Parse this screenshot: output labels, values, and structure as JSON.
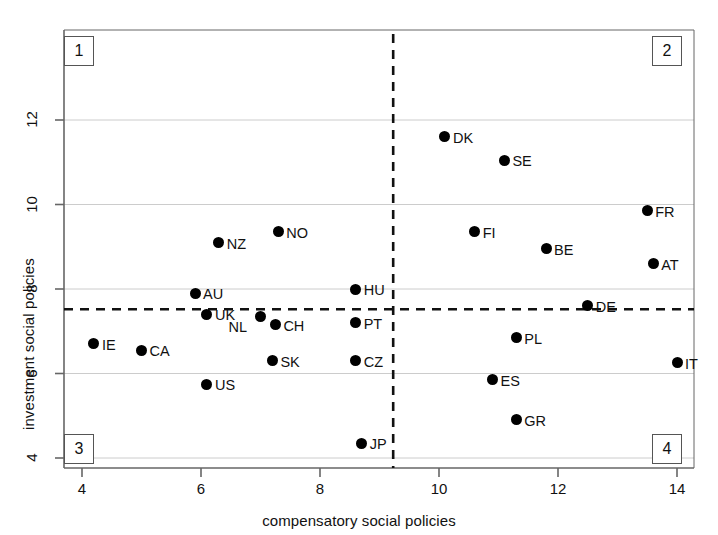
{
  "chart_data": {
    "type": "scatter",
    "title": "",
    "xlabel": "compensatory social policies",
    "ylabel": "investment social policies",
    "xlim": [
      3.6,
      14.4
    ],
    "ylim": [
      3.6,
      13.3
    ],
    "xticks": [
      4,
      6,
      8,
      10,
      12,
      14
    ],
    "yticks": [
      4,
      6,
      8,
      10,
      12
    ],
    "grid": "horizontal-only",
    "legend": "none",
    "reference_lines": {
      "vertical_x": 9.23,
      "horizontal_y": 7.52,
      "style": "dashed"
    },
    "quadrant_labels": [
      {
        "id": "1",
        "corner": "top-left"
      },
      {
        "id": "2",
        "corner": "top-right"
      },
      {
        "id": "3",
        "corner": "bottom-left"
      },
      {
        "id": "4",
        "corner": "bottom-right"
      }
    ],
    "points": [
      {
        "label": "IE",
        "x": 4.2,
        "y": 6.7,
        "label_side": "right"
      },
      {
        "label": "CA",
        "x": 5.0,
        "y": 6.55,
        "label_side": "right"
      },
      {
        "label": "AU",
        "x": 5.9,
        "y": 7.9,
        "label_side": "right"
      },
      {
        "label": "UK",
        "x": 6.1,
        "y": 7.4,
        "label_side": "right"
      },
      {
        "label": "US",
        "x": 6.1,
        "y": 5.75,
        "label_side": "right"
      },
      {
        "label": "NZ",
        "x": 6.3,
        "y": 9.1,
        "label_side": "right"
      },
      {
        "label": "NL",
        "x": 7.0,
        "y": 7.35,
        "label_side": "left"
      },
      {
        "label": "SK",
        "x": 7.2,
        "y": 6.3,
        "label_side": "right"
      },
      {
        "label": "CH",
        "x": 7.25,
        "y": 7.15,
        "label_side": "right"
      },
      {
        "label": "NO",
        "x": 7.3,
        "y": 9.35,
        "label_side": "right"
      },
      {
        "label": "CZ",
        "x": 8.6,
        "y": 6.3,
        "label_side": "right"
      },
      {
        "label": "PT",
        "x": 8.6,
        "y": 7.2,
        "label_side": "right"
      },
      {
        "label": "HU",
        "x": 8.6,
        "y": 8.0,
        "label_side": "right"
      },
      {
        "label": "JP",
        "x": 8.7,
        "y": 4.35,
        "label_side": "right"
      },
      {
        "label": "DK",
        "x": 10.1,
        "y": 11.6,
        "label_side": "right"
      },
      {
        "label": "FI",
        "x": 10.6,
        "y": 9.35,
        "label_side": "right"
      },
      {
        "label": "ES",
        "x": 10.9,
        "y": 5.85,
        "label_side": "right"
      },
      {
        "label": "SE",
        "x": 11.1,
        "y": 11.05,
        "label_side": "right"
      },
      {
        "label": "GR",
        "x": 11.3,
        "y": 4.9,
        "label_side": "right"
      },
      {
        "label": "PL",
        "x": 11.3,
        "y": 6.85,
        "label_side": "right"
      },
      {
        "label": "BE",
        "x": 11.8,
        "y": 8.95,
        "label_side": "right"
      },
      {
        "label": "DE",
        "x": 12.5,
        "y": 7.6,
        "label_side": "right"
      },
      {
        "label": "FR",
        "x": 13.5,
        "y": 9.85,
        "label_side": "right"
      },
      {
        "label": "AT",
        "x": 13.6,
        "y": 8.6,
        "label_side": "right"
      },
      {
        "label": "IT",
        "x": 14.0,
        "y": 6.25,
        "label_side": "right"
      }
    ]
  },
  "axes": {
    "x_title": "compensatory social policies",
    "y_title": "investment social policies",
    "x_tick_labels": [
      "4",
      "6",
      "8",
      "10",
      "12",
      "14"
    ],
    "y_tick_labels": [
      "4",
      "6",
      "8",
      "10",
      "12"
    ]
  },
  "quadrants": {
    "q1": "1",
    "q2": "2",
    "q3": "3",
    "q4": "4"
  },
  "colors": {
    "point": "#000000",
    "grid": "#cccccc",
    "axis": "#666666",
    "dashed": "#111111"
  }
}
